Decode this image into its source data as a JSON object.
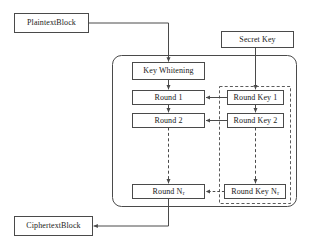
{
  "diagram": {
    "colors": {
      "stroke": "#4a4a4a",
      "box_fill": "#ffffff",
      "text": "#1a1a1a",
      "background": "#ffffff"
    },
    "nodes": {
      "plaintext": {
        "label": "PlaintextBlock"
      },
      "ciphertext": {
        "label": "CiphertextBlock"
      },
      "secret_key": {
        "label": "Secret Key"
      },
      "key_whitening": {
        "label": "Key Whitening"
      },
      "round1": {
        "label": "Round 1"
      },
      "round2": {
        "label": "Round 2"
      },
      "round_n": {
        "label_main": "Round N",
        "label_sub": "r"
      },
      "round_key1": {
        "label": "Round Key 1"
      },
      "round_key2": {
        "label": "Round Key 2"
      },
      "round_key_n": {
        "label_main": "Round Key N",
        "label_sub": "r"
      }
    },
    "groups": {
      "cipher_body": {
        "style": "rounded-solid"
      },
      "key_schedule": {
        "style": "dashed"
      }
    },
    "edges": [
      {
        "from": "plaintext",
        "to": "key_whitening",
        "style": "solid"
      },
      {
        "from": "key_whitening",
        "to": "round1",
        "style": "solid"
      },
      {
        "from": "round1",
        "to": "round2",
        "style": "solid"
      },
      {
        "from": "round2",
        "to": "round_n",
        "style": "dashed"
      },
      {
        "from": "round_n",
        "to": "ciphertext",
        "style": "solid"
      },
      {
        "from": "secret_key",
        "to": "round_key1",
        "style": "solid"
      },
      {
        "from": "round_key1",
        "to": "round_key2",
        "style": "solid"
      },
      {
        "from": "round_key2",
        "to": "round_key_n",
        "style": "dashed"
      },
      {
        "from": "round_key1",
        "to": "round1",
        "style": "solid"
      },
      {
        "from": "round_key2",
        "to": "round2",
        "style": "solid"
      },
      {
        "from": "round_key_n",
        "to": "round_n",
        "style": "dashed"
      }
    ]
  }
}
